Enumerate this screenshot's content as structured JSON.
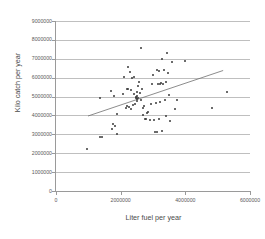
{
  "chart_data": {
    "type": "scatter",
    "title": "",
    "xlabel": "Liter fuel per year",
    "ylabel": "Kilo catch per year",
    "xlim": [
      0,
      6000000
    ],
    "ylim": [
      0,
      9000000
    ],
    "xticks": [
      "0",
      "2000000",
      "4000000",
      "6000000"
    ],
    "xtick_values": [
      0,
      2000000,
      4000000,
      6000000
    ],
    "yticks": [
      "0",
      "1000000",
      "2000000",
      "3000000",
      "4000000",
      "5000000",
      "6000000",
      "7000000",
      "8000000",
      "9000000"
    ],
    "ytick_values": [
      0,
      1000000,
      2000000,
      3000000,
      4000000,
      5000000,
      6000000,
      7000000,
      8000000,
      9000000
    ],
    "grid": "horizontal",
    "legend": "none",
    "marker_color": "#3a3a3a",
    "gridline_color": "#bfbfbf",
    "axis_color": "#9a9a9a",
    "trendline": {
      "label": "linear trend",
      "color": "#6e6e6e",
      "x_start": 990000,
      "y_start": 3970000,
      "x_end": 5170000,
      "y_end": 6380000
    },
    "points": [
      {
        "x": 960000,
        "y": 2220000
      },
      {
        "x": 1360000,
        "y": 4900000
      },
      {
        "x": 1370000,
        "y": 2870000
      },
      {
        "x": 1410000,
        "y": 2840000
      },
      {
        "x": 1690000,
        "y": 5290000
      },
      {
        "x": 1730000,
        "y": 3270000
      },
      {
        "x": 1760000,
        "y": 3530000
      },
      {
        "x": 1790000,
        "y": 5020000
      },
      {
        "x": 1840000,
        "y": 3450000
      },
      {
        "x": 1880000,
        "y": 3040000
      },
      {
        "x": 1900000,
        "y": 4070000
      },
      {
        "x": 2080000,
        "y": 5120000
      },
      {
        "x": 2110000,
        "y": 6050000
      },
      {
        "x": 2160000,
        "y": 4380000
      },
      {
        "x": 2190000,
        "y": 5420000
      },
      {
        "x": 2210000,
        "y": 4480000
      },
      {
        "x": 2230000,
        "y": 6550000
      },
      {
        "x": 2240000,
        "y": 5380000
      },
      {
        "x": 2260000,
        "y": 4440000
      },
      {
        "x": 2290000,
        "y": 6310000
      },
      {
        "x": 2310000,
        "y": 5350000
      },
      {
        "x": 2330000,
        "y": 4330000
      },
      {
        "x": 2360000,
        "y": 5990000
      },
      {
        "x": 2380000,
        "y": 4560000
      },
      {
        "x": 2400000,
        "y": 6010000
      },
      {
        "x": 2420000,
        "y": 5130000
      },
      {
        "x": 2450000,
        "y": 4620000
      },
      {
        "x": 2470000,
        "y": 4970000
      },
      {
        "x": 2480000,
        "y": 4910000
      },
      {
        "x": 2490000,
        "y": 4850000
      },
      {
        "x": 2500000,
        "y": 5010000
      },
      {
        "x": 2510000,
        "y": 4780000
      },
      {
        "x": 2520000,
        "y": 5240000
      },
      {
        "x": 2540000,
        "y": 5550000
      },
      {
        "x": 2550000,
        "y": 4950000
      },
      {
        "x": 2570000,
        "y": 5750000
      },
      {
        "x": 2590000,
        "y": 5180000
      },
      {
        "x": 2620000,
        "y": 7580000
      },
      {
        "x": 2640000,
        "y": 4820000
      },
      {
        "x": 2660000,
        "y": 5420000
      },
      {
        "x": 2680000,
        "y": 4030000
      },
      {
        "x": 2700000,
        "y": 4410000
      },
      {
        "x": 2730000,
        "y": 4520000
      },
      {
        "x": 2760000,
        "y": 3790000
      },
      {
        "x": 2790000,
        "y": 3820000
      },
      {
        "x": 2820000,
        "y": 4120000
      },
      {
        "x": 2860000,
        "y": 4170000
      },
      {
        "x": 2900000,
        "y": 3750000
      },
      {
        "x": 2950000,
        "y": 4610000
      },
      {
        "x": 2980000,
        "y": 5640000
      },
      {
        "x": 3010000,
        "y": 6120000
      },
      {
        "x": 3040000,
        "y": 3770000
      },
      {
        "x": 3070000,
        "y": 3120000
      },
      {
        "x": 3090000,
        "y": 4670000
      },
      {
        "x": 3110000,
        "y": 3140000
      },
      {
        "x": 3130000,
        "y": 6390000
      },
      {
        "x": 3150000,
        "y": 5690000
      },
      {
        "x": 3170000,
        "y": 3830000
      },
      {
        "x": 3190000,
        "y": 6360000
      },
      {
        "x": 3210000,
        "y": 5640000
      },
      {
        "x": 3230000,
        "y": 4720000
      },
      {
        "x": 3250000,
        "y": 5730000
      },
      {
        "x": 3270000,
        "y": 7010000
      },
      {
        "x": 3290000,
        "y": 3180000
      },
      {
        "x": 3310000,
        "y": 5680000
      },
      {
        "x": 3330000,
        "y": 6400000
      },
      {
        "x": 3360000,
        "y": 4830000
      },
      {
        "x": 3390000,
        "y": 3960000
      },
      {
        "x": 3410000,
        "y": 5790000
      },
      {
        "x": 3430000,
        "y": 7290000
      },
      {
        "x": 3460000,
        "y": 6240000
      },
      {
        "x": 3490000,
        "y": 5100000
      },
      {
        "x": 3520000,
        "y": 3730000
      },
      {
        "x": 3600000,
        "y": 6850000
      },
      {
        "x": 3680000,
        "y": 4350000
      },
      {
        "x": 3740000,
        "y": 4840000
      },
      {
        "x": 4000000,
        "y": 6900000
      },
      {
        "x": 4840000,
        "y": 4370000
      },
      {
        "x": 5290000,
        "y": 5240000
      }
    ]
  }
}
